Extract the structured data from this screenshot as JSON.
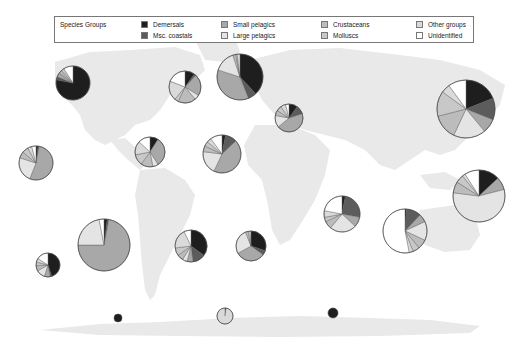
{
  "legend": {
    "title": "Species Groups",
    "items": [
      {
        "key": "demersals",
        "label": "Demersals",
        "color": "#1e1e1e"
      },
      {
        "key": "misc_coastals",
        "label": "Msc. coastals",
        "color": "#5c5c5c"
      },
      {
        "key": "small_pelagics",
        "label": "Small pelagics",
        "color": "#a8a8a8"
      },
      {
        "key": "large_pelagics",
        "label": "Large pelagics",
        "color": "#e4e4e4"
      },
      {
        "key": "crustaceans",
        "label": "Crustaceans",
        "color": "#bcbcbc"
      },
      {
        "key": "molluscs",
        "label": "Molluscs",
        "color": "#c8c8c8"
      },
      {
        "key": "other_groups",
        "label": "Other groups",
        "color": "#dadada"
      },
      {
        "key": "unidentified",
        "label": "Unidentified",
        "color": "#ffffff"
      }
    ]
  },
  "chart_data": {
    "type": "pie",
    "categories": [
      "Demersals",
      "Msc. coastals",
      "Small pelagics",
      "Large pelagics",
      "Crustaceans",
      "Molluscs",
      "Other groups",
      "Unidentified"
    ],
    "legend_position": "top",
    "pies": [
      {
        "id": "ne_pacific_north",
        "cx": 73,
        "cy": 83,
        "r": 17,
        "values": [
          78,
          3,
          4,
          0,
          3,
          3,
          0,
          9
        ]
      },
      {
        "id": "nw_atlantic",
        "cx": 185,
        "cy": 87,
        "r": 16,
        "values": [
          10,
          2,
          22,
          5,
          18,
          4,
          20,
          19
        ]
      },
      {
        "id": "ne_atlantic",
        "cx": 240,
        "cy": 77,
        "r": 23,
        "values": [
          38,
          6,
          36,
          15,
          2,
          1,
          2,
          0
        ]
      },
      {
        "id": "mediterranean",
        "cx": 289,
        "cy": 118,
        "r": 14,
        "values": [
          10,
          10,
          44,
          14,
          6,
          6,
          6,
          4
        ]
      },
      {
        "id": "nw_pacific",
        "cx": 466,
        "cy": 109,
        "r": 29,
        "values": [
          19,
          12,
          8,
          18,
          14,
          14,
          5,
          10
        ]
      },
      {
        "id": "e_central_pacific",
        "cx": 36,
        "cy": 163,
        "r": 17,
        "values": [
          2,
          1,
          53,
          24,
          6,
          6,
          4,
          4
        ]
      },
      {
        "id": "w_central_atlantic",
        "cx": 150,
        "cy": 152,
        "r": 15,
        "values": [
          9,
          0,
          32,
          6,
          13,
          12,
          15,
          13
        ]
      },
      {
        "id": "e_central_atlantic",
        "cx": 222,
        "cy": 154,
        "r": 19,
        "values": [
          3,
          10,
          44,
          20,
          5,
          4,
          4,
          10
        ]
      },
      {
        "id": "w_indian",
        "cx": 342,
        "cy": 214,
        "r": 18,
        "values": [
          3,
          25,
          9,
          24,
          7,
          4,
          6,
          22
        ]
      },
      {
        "id": "e_indian",
        "cx": 405,
        "cy": 231,
        "r": 22,
        "values": [
          1,
          11,
          6,
          14,
          7,
          5,
          3,
          53
        ]
      },
      {
        "id": "w_central_pacific",
        "cx": 479,
        "cy": 196,
        "r": 26,
        "values": [
          13,
          0,
          8,
          56,
          7,
          5,
          2,
          9
        ]
      },
      {
        "id": "se_pacific_small",
        "cx": 48,
        "cy": 265,
        "r": 12,
        "values": [
          45,
          2,
          8,
          12,
          7,
          5,
          5,
          16
        ]
      },
      {
        "id": "se_pacific",
        "cx": 104,
        "cy": 245,
        "r": 26,
        "values": [
          2,
          1,
          72,
          22,
          0,
          0,
          0,
          3
        ]
      },
      {
        "id": "sw_atlantic",
        "cx": 191,
        "cy": 246,
        "r": 16,
        "values": [
          35,
          13,
          6,
          5,
          6,
          8,
          20,
          7
        ]
      },
      {
        "id": "se_atlantic",
        "cx": 251,
        "cy": 246,
        "r": 15,
        "values": [
          30,
          5,
          32,
          27,
          3,
          0,
          2,
          1
        ]
      },
      {
        "id": "antarctic_pacific",
        "cx": 118,
        "cy": 318,
        "r": 4,
        "values": [
          100,
          0,
          0,
          0,
          0,
          0,
          0,
          0
        ]
      },
      {
        "id": "antarctic_atlantic",
        "cx": 225,
        "cy": 316,
        "r": 8,
        "values": [
          2,
          0,
          0,
          0,
          0,
          0,
          98,
          0
        ]
      },
      {
        "id": "antarctic_indian",
        "cx": 333,
        "cy": 313,
        "r": 5,
        "values": [
          100,
          0,
          0,
          0,
          0,
          0,
          0,
          0
        ]
      }
    ]
  }
}
